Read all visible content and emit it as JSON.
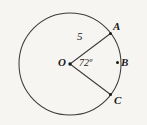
{
  "figure": {
    "type": "circle-with-central-angle",
    "background_color": "#f6f5f2",
    "stroke_color": "#3c3c3c",
    "text_color": "#1a1a1a",
    "circle": {
      "center_label": "O",
      "center_x": 70,
      "center_y": 64,
      "radius": 51
    },
    "points": [
      {
        "id": "A",
        "label": "A",
        "x": 110,
        "y": 30,
        "on_circle": true
      },
      {
        "id": "B",
        "label": "B",
        "x": 118,
        "y": 62,
        "on_circle": true
      },
      {
        "id": "C",
        "label": "C",
        "x": 111,
        "y": 94,
        "on_circle": true
      }
    ],
    "segments": [
      {
        "id": "OA",
        "from": "O",
        "to": "A",
        "label": "5"
      },
      {
        "id": "OC",
        "from": "O",
        "to": "C",
        "label": ""
      }
    ],
    "radius_label": "5",
    "angle": {
      "vertex": "O",
      "label": "72º",
      "value": 72,
      "unit": "degrees",
      "between": [
        "OA",
        "OC"
      ]
    }
  }
}
